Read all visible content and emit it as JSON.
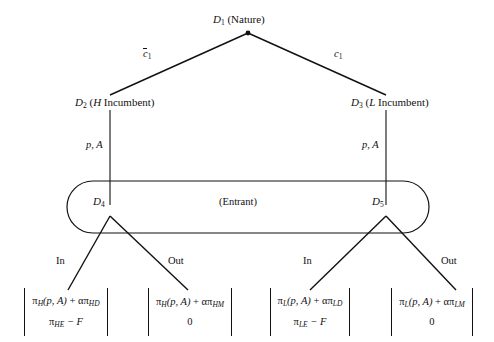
{
  "figure": {
    "type": "extensive-form-game-tree",
    "ink_color": "#111111",
    "background_color": "#ffffff"
  },
  "nodes": {
    "root": {
      "id": "D",
      "index": "1",
      "player": "(Nature)"
    },
    "incumbent_high": {
      "id": "D",
      "index": "2",
      "player": "(H Incumbent)",
      "player_type": "H",
      "player_rest": " Incumbent)"
    },
    "incumbent_low": {
      "id": "D",
      "index": "3",
      "player": "(L Incumbent)",
      "player_type": "L",
      "player_rest": " Incumbent)"
    },
    "entrant_left": {
      "id": "D",
      "index": "4"
    },
    "entrant_right": {
      "id": "D",
      "index": "5"
    }
  },
  "information_set": {
    "player_label": "(Entrant)"
  },
  "edges": {
    "nature_left": {
      "label_base": "c",
      "label_sub": "1",
      "has_overbar": true
    },
    "nature_right": {
      "label_base": "c",
      "label_sub": "1",
      "has_overbar": false
    },
    "incumbent_high_action": "p, A",
    "incumbent_low_action": "p, A",
    "entrant_left_in": "In",
    "entrant_left_out": "Out",
    "entrant_right_in": "In",
    "entrant_right_out": "Out"
  },
  "payoffs": [
    {
      "name": "high-in",
      "top": {
        "pi": "π",
        "sub1": "H",
        "args": "(p, A)",
        "plus": " + ",
        "alpha": "απ",
        "sub2": "HD"
      },
      "bottom": {
        "pi": "π",
        "sub1": "HE",
        "rest": " − F"
      }
    },
    {
      "name": "high-out",
      "top": {
        "pi": "π",
        "sub1": "H",
        "args": "(p, A)",
        "plus": " + ",
        "alpha": "απ",
        "sub2": "HM"
      },
      "bottom": {
        "value": "0"
      }
    },
    {
      "name": "low-in",
      "top": {
        "pi": "π",
        "sub1": "L",
        "args": "(p, A)",
        "plus": " + ",
        "alpha": "απ",
        "sub2": "LD"
      },
      "bottom": {
        "pi": "π",
        "sub1": "LE",
        "rest": " − F"
      }
    },
    {
      "name": "low-out",
      "top": {
        "pi": "π",
        "sub1": "L",
        "args": "(p, A)",
        "plus": " + ",
        "alpha": "απ",
        "sub2": "LM"
      },
      "bottom": {
        "value": "0"
      }
    }
  ]
}
